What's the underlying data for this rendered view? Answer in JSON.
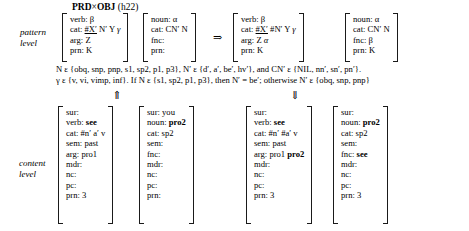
{
  "figure": {
    "title_main": "PRD",
    "title_times": "×",
    "title_main2": "OBJ",
    "title_ref": "(h22)",
    "pattern_label_line1": "pattern",
    "pattern_label_line2": "level",
    "content_label_line1": "content",
    "content_label_line2": "level",
    "rule_arrow": "⇒",
    "up_arrow": "⇑",
    "down_arrow": "⇓"
  },
  "pattern_level": {
    "input": {
      "verb_pattern": {
        "rows": [
          {
            "attr": "verb:",
            "value": "β",
            "greek": true,
            "bold": false
          },
          {
            "attr": "cat:",
            "value": "#X′ N′ Y γ",
            "greek": false,
            "bold": false
          },
          {
            "attr": "arg:",
            "value": "Z",
            "greek": false,
            "bold": false
          },
          {
            "attr": "prn:",
            "value": "K",
            "greek": false,
            "bold": false
          }
        ]
      },
      "noun_pattern": {
        "rows": [
          {
            "attr": "noun:",
            "value": "α",
            "greek": true,
            "bold": false
          },
          {
            "attr": "cat:",
            "value": "CN′ N",
            "greek": false,
            "bold": false
          },
          {
            "attr": "fnc:",
            "value": "",
            "greek": false,
            "bold": false
          },
          {
            "attr": "prn:",
            "value": "",
            "greek": false,
            "bold": false
          }
        ]
      }
    },
    "output": {
      "verb_pattern": {
        "rows": [
          {
            "attr": "verb:",
            "value": "β",
            "greek": true,
            "bold": false
          },
          {
            "attr": "cat:",
            "value": "#X′ #N′ Y γ",
            "greek": false,
            "bold": false
          },
          {
            "attr": "arg:",
            "value": "Z α",
            "greek": false,
            "bold": false
          },
          {
            "attr": "prn:",
            "value": "K",
            "greek": false,
            "bold": false
          }
        ]
      },
      "noun_pattern": {
        "rows": [
          {
            "attr": "noun:",
            "value": "α",
            "greek": true,
            "bold": false
          },
          {
            "attr": "cat:",
            "value": "CN′ N",
            "greek": false,
            "bold": false
          },
          {
            "attr": "fnc:",
            "value": "β",
            "greek": true,
            "bold": false
          },
          {
            "attr": "prn:",
            "value": "K",
            "greek": false,
            "bold": false
          }
        ]
      }
    },
    "constraints": {
      "line1": "N ε {obq, snp, pnp, s1, sp2, p1, p3}, N′ ε {d′, a′, be′, hv′}, and CN′ ε {NIL, nn′, sn′, pn′}.",
      "line2": "γ ε {v, vi, vimp, inf}. If N ε {s1, sp2, p1, p3}, then N′ = be′; otherwise N′ ε {obq, snp, pnp}"
    }
  },
  "content_level": {
    "input": {
      "verb_content": {
        "rows": [
          {
            "attr": "sur:",
            "value": "",
            "bold": false
          },
          {
            "attr": "verb:",
            "value": "see",
            "bold": true
          },
          {
            "attr": "cat:",
            "value": "#n′ a′ v",
            "bold": false
          },
          {
            "attr": "sem:",
            "value": "past",
            "bold": false
          },
          {
            "attr": "arg:",
            "value": "pro1",
            "bold": false
          },
          {
            "attr": "mdr:",
            "value": "",
            "bold": false
          },
          {
            "attr": "nc:",
            "value": "",
            "bold": false
          },
          {
            "attr": "pc:",
            "value": "",
            "bold": false
          },
          {
            "attr": "prn:",
            "value": "3",
            "bold": false
          }
        ]
      },
      "noun_content": {
        "rows": [
          {
            "attr": "sur:",
            "value": "you",
            "bold": false
          },
          {
            "attr": "noun:",
            "value": "pro2",
            "bold": true
          },
          {
            "attr": "cat:",
            "value": "sp2",
            "bold": false
          },
          {
            "attr": "sem:",
            "value": "",
            "bold": false
          },
          {
            "attr": "fnc:",
            "value": "",
            "bold": false
          },
          {
            "attr": "mdr:",
            "value": "",
            "bold": false
          },
          {
            "attr": "nc:",
            "value": "",
            "bold": false
          },
          {
            "attr": "pc:",
            "value": "",
            "bold": false
          },
          {
            "attr": "prn:",
            "value": "",
            "bold": false
          }
        ]
      }
    },
    "output": {
      "verb_content": {
        "rows": [
          {
            "attr": "sur:",
            "value": "",
            "bold": false
          },
          {
            "attr": "verb:",
            "value": "see",
            "bold": true
          },
          {
            "attr": "cat:",
            "value": "#n′ #a′ v",
            "bold": false
          },
          {
            "attr": "sem:",
            "value": "past",
            "bold": false
          },
          {
            "attr": "arg:",
            "value": "pro1 pro2",
            "bold": false
          },
          {
            "attr": "mdr:",
            "value": "",
            "bold": false
          },
          {
            "attr": "nc:",
            "value": "",
            "bold": false
          },
          {
            "attr": "pc:",
            "value": "",
            "bold": false
          },
          {
            "attr": "prn:",
            "value": "3",
            "bold": false
          }
        ]
      },
      "noun_content": {
        "rows": [
          {
            "attr": "sur:",
            "value": "",
            "bold": false
          },
          {
            "attr": "noun:",
            "value": "pro2",
            "bold": true
          },
          {
            "attr": "cat:",
            "value": "sp2",
            "bold": false
          },
          {
            "attr": "sem:",
            "value": "",
            "bold": false
          },
          {
            "attr": "fnc:",
            "value": "see",
            "bold": true
          },
          {
            "attr": "mdr:",
            "value": "",
            "bold": false
          },
          {
            "attr": "nc:",
            "value": "",
            "bold": false
          },
          {
            "attr": "pc:",
            "value": "",
            "bold": false
          },
          {
            "attr": "prn:",
            "value": "3",
            "bold": false
          }
        ]
      }
    }
  }
}
